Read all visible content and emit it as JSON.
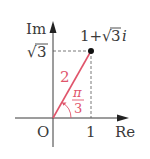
{
  "diagram": {
    "type": "complex-plane",
    "axes": {
      "imag_label": "Im",
      "real_label": "Re",
      "origin_label": "O"
    },
    "ticks": {
      "x_tick": "1",
      "y_tick_radical": "√",
      "y_tick_value": "3"
    },
    "point": {
      "label_prefix": "1+",
      "label_radical": "√",
      "label_value": "3",
      "label_suffix": "i",
      "re": 1,
      "im": 1.732
    },
    "modulus_label": "2",
    "argument": {
      "numerator": "π",
      "denominator": "3"
    },
    "colors": {
      "axis": "#3a3a3a",
      "vector": "#e0556b",
      "text": "#3a3a3a",
      "accent_text": "#e0556b",
      "dashed": "#555555",
      "point": "#111111"
    }
  }
}
